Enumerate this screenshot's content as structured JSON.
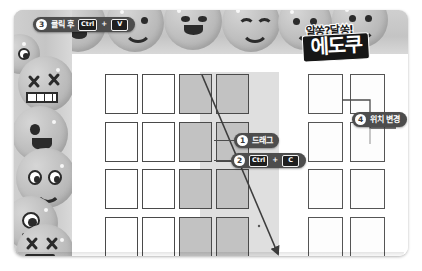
{
  "document": {
    "title": "에도쿠 퍼즐 셀 복사 안내",
    "logo": {
      "tagline": "알쏭?달쏭!",
      "name": "에도쿠"
    }
  },
  "callouts": [
    {
      "id": "callout-3",
      "number": "3",
      "text": "클릭 후",
      "keys": [
        "Ctrl",
        "V"
      ],
      "separator": "+",
      "position": "top-left"
    },
    {
      "id": "callout-1",
      "number": "1",
      "text": "드래그",
      "keys": [],
      "separator": "",
      "position": "center-right"
    },
    {
      "id": "callout-2",
      "number": "2",
      "text": "",
      "keys": [
        "Ctrl",
        "C"
      ],
      "separator": "+",
      "position": "center-right"
    },
    {
      "id": "callout-4",
      "number": "4",
      "text": "위치 변경",
      "keys": [],
      "separator": "",
      "position": "right"
    }
  ],
  "main_grid": {
    "name": "퍼즐 격자",
    "columns": 4,
    "rows": 4,
    "selected_columns": [
      3,
      4
    ],
    "cells": [
      [
        "empty",
        "empty",
        "selected",
        "selected"
      ],
      [
        "empty",
        "empty",
        "selected",
        "selected"
      ],
      [
        "empty",
        "empty",
        "selected",
        "selected"
      ],
      [
        "empty",
        "empty",
        "selected",
        "selected"
      ]
    ]
  },
  "right_grid": {
    "name": "붙여넣기 결과 격자",
    "columns": 2,
    "rows": 4,
    "cells": [
      [
        "empty",
        "empty"
      ],
      [
        "empty",
        "empty"
      ],
      [
        "empty",
        "empty"
      ],
      [
        "empty",
        "empty"
      ]
    ]
  },
  "decoration": {
    "band_top": "smiley-face-band",
    "band_left": "smiley-face-band",
    "faces": [
      "dizzy-face",
      "laughing-face",
      "smiling-face",
      "winking-face",
      "x-eyes-face",
      "grimacing-face",
      "tongue-face",
      "happy-face",
      "monocle-face",
      "squint-face"
    ]
  },
  "colors": {
    "callout_bg": "#4d4d4d",
    "key_bg": "#1f1f1f",
    "selection": "#c2c2c2",
    "cell_border": "#4a4a4a",
    "logo_bg": "#161616",
    "band": "#c9c9c9"
  }
}
